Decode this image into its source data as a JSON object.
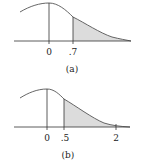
{
  "figure": {
    "panels": [
      {
        "id": "a",
        "caption": "(a)",
        "tick_labels": [
          "0",
          ".7"
        ],
        "shaded_region": "right tail from .7"
      },
      {
        "id": "b",
        "caption": "(b)",
        "tick_labels": [
          "0",
          ".5",
          "2"
        ],
        "shaded_region": "between .5 and 2"
      }
    ],
    "colors": {
      "curve": "#555555",
      "shade": "#dcdcdc",
      "axis": "#333333"
    }
  }
}
